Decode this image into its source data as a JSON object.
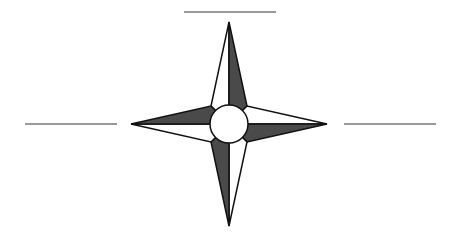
{
  "diagram": {
    "type": "compass-rose",
    "points": 4,
    "colors": {
      "background": "#ffffff",
      "dark_fill": "#4a4a4a",
      "light_fill": "#ffffff",
      "stroke": "#111111",
      "blank_line": "#777777"
    },
    "center": {
      "x": 229,
      "y": 124,
      "r": 19
    },
    "tips": {
      "north": {
        "x": 229,
        "y": 22
      },
      "east": {
        "x": 327,
        "y": 124
      },
      "south": {
        "x": 229,
        "y": 226
      },
      "west": {
        "x": 131,
        "y": 124
      }
    },
    "blank_label_lines": [
      {
        "name": "north",
        "x1": 184,
        "y1": 12,
        "x2": 276,
        "y2": 12
      },
      {
        "name": "west",
        "x1": 25,
        "y1": 124,
        "x2": 117,
        "y2": 124
      },
      {
        "name": "east",
        "x1": 344,
        "y1": 124,
        "x2": 436,
        "y2": 124
      }
    ]
  }
}
